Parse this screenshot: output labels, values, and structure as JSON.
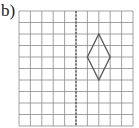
{
  "label": "b)",
  "grid": {
    "columns": 10,
    "rows": 10,
    "line_color": "#8a8a8a"
  },
  "mirror_line": {
    "column_index": 5,
    "style": "dashed",
    "color": "#444444"
  },
  "shape": {
    "type": "rhombus",
    "vertices": [
      [
        7,
        2
      ],
      [
        8,
        4
      ],
      [
        7,
        6
      ],
      [
        6,
        4
      ]
    ],
    "color": "#555555"
  }
}
